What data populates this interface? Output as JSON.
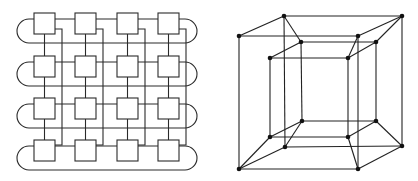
{
  "figure": {
    "panels": [
      {
        "id": "torus-mesh",
        "description": "4x4 wrap-around mesh (2D torus) of processor boxes",
        "rows": 4,
        "cols": 4,
        "colors": {
          "stroke": "#2a2a2a",
          "fill": "#ffffff"
        },
        "box_size": 21,
        "col_x": [
          34,
          75,
          117,
          158
        ],
        "row_y": [
          13,
          56,
          98,
          140
        ],
        "col_offset_dx": 28,
        "row_link_dy": 6,
        "row_loop_dy": 30,
        "arc_left_x": 17,
        "arc_right_x": 197,
        "col_offset_top_dy": 16,
        "col_offset_bottom_dy": 5
      },
      {
        "id": "tesseract",
        "description": "4-dimensional hypercube projection with 16 vertices",
        "colors": {
          "stroke": "#222222",
          "vertex": "#111111"
        },
        "vertex_radius": 2.3,
        "vertices": {
          "A_TL": [
            29,
            36
          ],
          "A_TR": [
            148,
            36
          ],
          "A_BL": [
            29,
            169
          ],
          "A_BR": [
            148,
            169
          ],
          "B_TL": [
            74,
            16
          ],
          "B_TR": [
            192,
            16
          ],
          "B_BL": [
            75,
            147
          ],
          "B_BR": [
            192,
            146
          ],
          "C_TL": [
            60,
            58
          ],
          "C_TR": [
            138,
            58
          ],
          "C_BL": [
            60,
            137
          ],
          "C_BR": [
            138,
            137
          ],
          "D_TL": [
            91,
            42
          ],
          "D_TR": [
            166,
            42
          ],
          "D_BL": [
            92,
            121
          ],
          "D_BR": [
            166,
            121
          ]
        },
        "edges": [
          [
            "A_TL",
            "A_TR"
          ],
          [
            "A_TR",
            "A_BR"
          ],
          [
            "A_BR",
            "A_BL"
          ],
          [
            "A_BL",
            "A_TL"
          ],
          [
            "B_TL",
            "B_TR"
          ],
          [
            "B_TR",
            "B_BR"
          ],
          [
            "B_BR",
            "B_BL"
          ],
          [
            "B_BL",
            "B_TL"
          ],
          [
            "C_TL",
            "C_TR"
          ],
          [
            "C_TR",
            "C_BR"
          ],
          [
            "C_BR",
            "C_BL"
          ],
          [
            "C_BL",
            "C_TL"
          ],
          [
            "D_TL",
            "D_TR"
          ],
          [
            "D_TR",
            "D_BR"
          ],
          [
            "D_BR",
            "D_BL"
          ],
          [
            "D_BL",
            "D_TL"
          ],
          [
            "A_TL",
            "B_TL"
          ],
          [
            "B_TL",
            "D_TL"
          ],
          [
            "D_TL",
            "C_TL"
          ],
          [
            "A_TR",
            "B_TR"
          ],
          [
            "B_TR",
            "D_TR"
          ],
          [
            "D_TR",
            "C_TR"
          ],
          [
            "A_TR",
            "C_TR"
          ],
          [
            "A_BL",
            "B_BL"
          ],
          [
            "B_BL",
            "D_BL"
          ],
          [
            "D_BL",
            "C_BL"
          ],
          [
            "A_BL",
            "C_BL"
          ],
          [
            "A_BR",
            "B_BR"
          ],
          [
            "B_BR",
            "D_BR"
          ],
          [
            "D_BR",
            "C_BR"
          ],
          [
            "A_BR",
            "C_BR"
          ]
        ]
      }
    ]
  }
}
